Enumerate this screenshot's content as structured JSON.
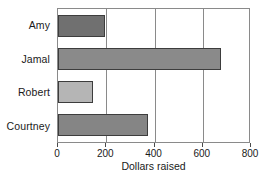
{
  "chart_data": {
    "type": "bar",
    "orientation": "horizontal",
    "title": "",
    "xlabel": "Dollars raised",
    "ylabel": "",
    "categories": [
      "Amy",
      "Jamal",
      "Robert",
      "Courtney"
    ],
    "values": [
      195,
      675,
      145,
      375
    ],
    "series": [
      {
        "name": "Dollars raised",
        "values": [
          195,
          675,
          145,
          375
        ]
      }
    ],
    "bar_colors": [
      "#707070",
      "#8a8a8a",
      "#b5b5b5",
      "#858585"
    ],
    "bar_edge_color": "#3d3d3d",
    "xlim": [
      0,
      800
    ],
    "xticks": [
      0,
      200,
      400,
      600,
      800
    ],
    "xtick_labels": [
      "0",
      "200",
      "400",
      "600",
      "800"
    ],
    "grid": true,
    "grid_axis": "x",
    "grid_color": "#8a8a8a",
    "legend": false,
    "frame_color": "#8a8a8a",
    "background": "#ffffff"
  }
}
